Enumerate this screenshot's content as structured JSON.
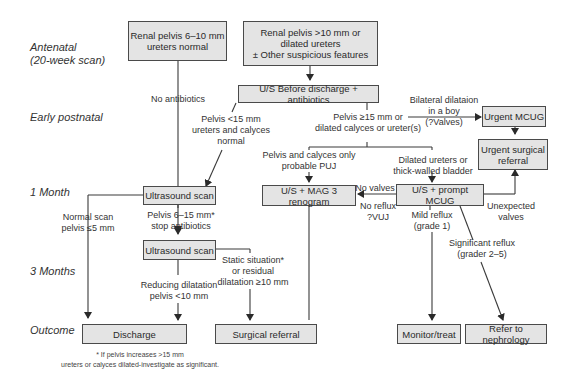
{
  "stages": [
    {
      "id": "antenatal",
      "label": "Antenatal\n(20-week scan)"
    },
    {
      "id": "early-postnatal",
      "label": "Early postnatal"
    },
    {
      "id": "1-month",
      "label": "1 Month"
    },
    {
      "id": "3-months",
      "label": "3 Months"
    },
    {
      "id": "outcome",
      "label": "Outcome"
    }
  ],
  "boxes": {
    "renal_6_10": "Renal pelvis 6–10 mm\nureters normal",
    "renal_gt10": "Renal pelvis >10 mm or\ndilated ureters\n± Other suspicious features",
    "us_before_discharge": "U/S Before discharge + antibiotics",
    "urgent_mcug": "Urgent MCUG",
    "urgent_surgical": "Urgent surgical\nreferral",
    "us_1month": "Ultrasound scan",
    "mag3": "U/S + MAG 3 renogram",
    "prompt_mcug": "U/S + prompt MCUG",
    "us_3month": "Ultrasound scan",
    "discharge": "Discharge",
    "surgical_referral": "Surgical referral",
    "monitor": "Monitor/treat",
    "nephrology": "Refer to nephrology"
  },
  "labels": {
    "no_antibiotics": "No antibiotics",
    "pelvis_lt15": "Pelvis <15 mm\nureters and calyces\nnormal",
    "pelvis_ge15": "Pelvis ≥15 mm  or\ndilated calyces or ureter(s)",
    "bilateral": "Bilateral dilataion\nin a boy\n(?Valves)",
    "pelvis_calyces_only": "Pelvis and calyces only\nprobable PUJ",
    "dilated_ureters": "Dilated ureters or\nthick-walled bladder",
    "no_valves": "No valves",
    "no_reflux": "No reflux\n?VUJ",
    "unexpected_valves": "Unexpected\nvalves",
    "normal_scan": "Normal scan\npelvis ≤5 mm",
    "pelvis_6_15": "Pelvis 6–15 mm*\nstop antibiotics",
    "mild_reflux": "Mild reflux\n(grade 1)",
    "significant_reflux": "Significant reflux\n(grader 2–5)",
    "static_situation": "Static situation*\nor residual\ndilatation ≥10 mm",
    "reducing_dilatation": "Reducing dilatation\npelvis <10 mm"
  },
  "footnote": "* If pelvis increases >15 mm\nureters or calyces dilated-investigate as significant.",
  "colors": {
    "box_fill": "#e4e4e4",
    "line": "#3a3a3a"
  }
}
